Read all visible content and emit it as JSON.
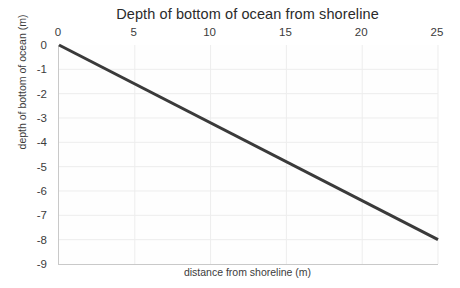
{
  "chart_data": {
    "type": "line",
    "title": "Depth of bottom of ocean from shoreline",
    "xlabel": "distance from shoreline (m)",
    "ylabel": "depth of bottom of ocean (m)",
    "x_axis_position": "top",
    "grid": true,
    "legend": null,
    "xlim": [
      0,
      25
    ],
    "ylim": [
      -9,
      0
    ],
    "xticks": [
      0,
      5,
      10,
      15,
      20,
      25
    ],
    "xtick_labels": [
      "0",
      "5",
      "10",
      "15",
      "20",
      "25"
    ],
    "yticks": [
      0,
      -1,
      -2,
      -3,
      -4,
      -5,
      -6,
      -7,
      -8,
      -9
    ],
    "ytick_labels": [
      "0",
      "-1",
      "-2",
      "-3",
      "-4",
      "-5",
      "-6",
      "-7",
      "-8",
      "-9"
    ],
    "series": [
      {
        "name": "ocean floor",
        "color": "#3a3a3a",
        "line_width": 3,
        "x": [
          0,
          25
        ],
        "values": [
          0,
          -8.0
        ],
        "points": [
          {
            "x": 0,
            "y": 0
          },
          {
            "x": 5,
            "y": -1.6
          },
          {
            "x": 10,
            "y": -3.2
          },
          {
            "x": 15,
            "y": -4.8
          },
          {
            "x": 20,
            "y": -6.4
          },
          {
            "x": 25,
            "y": -8.0
          }
        ],
        "slope": -0.32,
        "intercept": 0
      }
    ],
    "colors": {
      "line": "#3a3a3a",
      "grid": "#ededed",
      "axis": "#c9c9c9",
      "text": "#3c3c3c",
      "background": "#ffffff",
      "plot_background": "#fefefe"
    }
  }
}
